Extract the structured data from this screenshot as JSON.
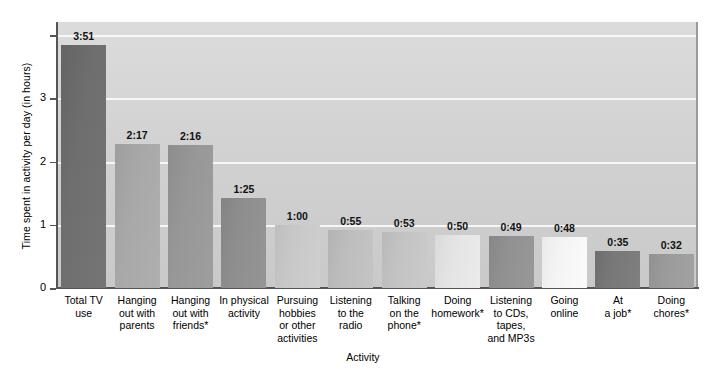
{
  "chart_data": {
    "type": "bar",
    "title": "",
    "xlabel": "Activity",
    "ylabel": "Time spent in activity per day (in hours)",
    "ylim": [
      0,
      4.2
    ],
    "yticks": [
      0,
      1,
      2,
      3,
      4
    ],
    "ytick_labels": [
      "0",
      "1",
      "2",
      "3",
      ""
    ],
    "grid": true,
    "legend": "none",
    "categories": [
      "Total TV\nuse",
      "Hanging\nout with\nparents",
      "Hanging\nout with\nfriends*",
      "In physical\nactivity",
      "Pursuing\nhobbies\nor other\nactivities",
      "Listening\nto the\nradio",
      "Talking\non the\nphone*",
      "Doing\nhomework*",
      "Listening\nto CDs,\ntapes,\nand MP3s",
      "Going\nonline",
      "At\na job*",
      "Doing\nchores*"
    ],
    "data_labels": [
      "3:51",
      "2:17",
      "2:16",
      "1:25",
      "1:00",
      "0:55",
      "0:53",
      "0:50",
      "0:49",
      "0:48",
      "0:35",
      "0:32"
    ],
    "values": [
      3.85,
      2.283,
      2.267,
      1.417,
      1.0,
      0.917,
      0.883,
      0.833,
      0.817,
      0.8,
      0.583,
      0.533
    ],
    "bar_colors": [
      "#6e6e6e",
      "#a8a8a8",
      "#979797",
      "#8e8e8e",
      "#c8c8c8",
      "#bdbdbd",
      "#c3c3c3",
      "#e4e4e4",
      "#919191",
      "#f4f4f4",
      "#787878",
      "#9b9b9b"
    ],
    "plot_background": "#d4d4d4",
    "gridline_color": "#f7f7f7",
    "axis_color": "#555555"
  }
}
